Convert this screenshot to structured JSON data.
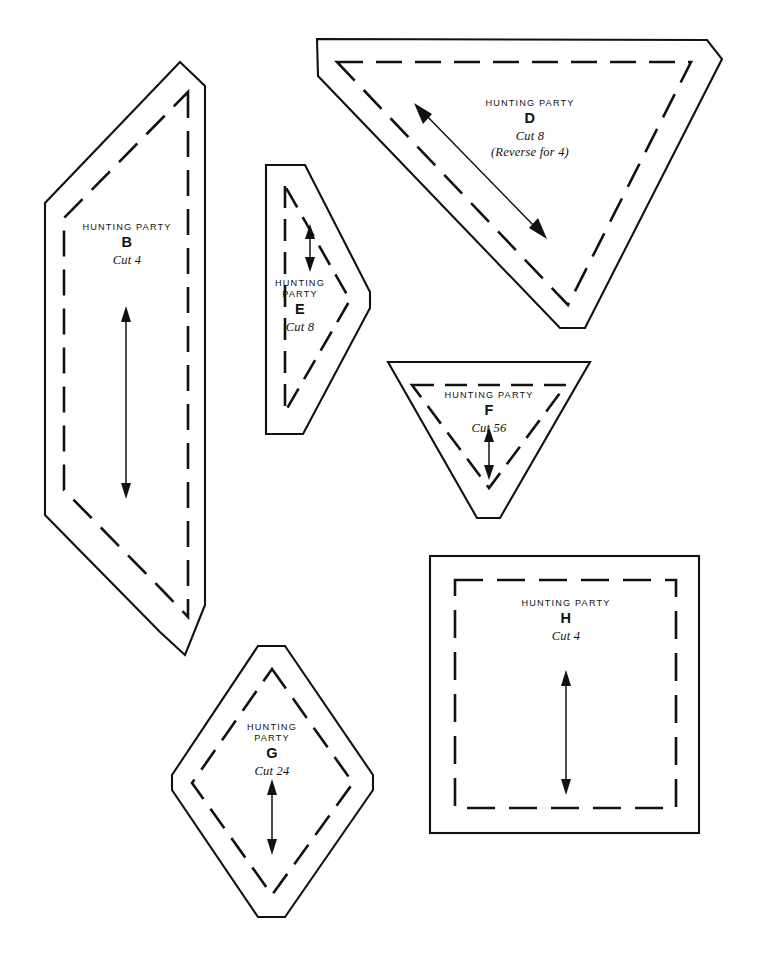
{
  "page": {
    "background_color": "#ffffff",
    "ink_color": "#111111",
    "width": 760,
    "height": 957
  },
  "pattern_name": "HUNTING PARTY",
  "templates": [
    {
      "id": "B",
      "shape": "parallelogram",
      "title": "HUNTING PARTY",
      "letter": "B",
      "cut": "Cut 4",
      "note": "",
      "grainline": "double-arrow-vertical"
    },
    {
      "id": "D",
      "shape": "triangle",
      "title": "HUNTING PARTY",
      "letter": "D",
      "cut": "Cut 8",
      "note": "(Reverse for 4)",
      "grainline": "double-arrow-diagonal"
    },
    {
      "id": "E",
      "shape": "triangle-right",
      "title_line1": "HUNTING",
      "title_line2": "PARTY",
      "title": "HUNTING PARTY",
      "letter": "E",
      "cut": "Cut 8",
      "note": "",
      "grainline": "double-arrow-vertical"
    },
    {
      "id": "F",
      "shape": "triangle-down",
      "title": "HUNTING PARTY",
      "letter": "F",
      "cut": "Cut 56",
      "note": "",
      "grainline": "double-arrow-vertical"
    },
    {
      "id": "G",
      "shape": "diamond",
      "title_line1": "HUNTING",
      "title_line2": "PARTY",
      "title": "HUNTING PARTY",
      "letter": "G",
      "cut": "Cut 24",
      "note": "",
      "grainline": "double-arrow-vertical"
    },
    {
      "id": "H",
      "shape": "square",
      "title": "HUNTING PARTY",
      "letter": "H",
      "cut": "Cut 4",
      "note": "",
      "grainline": "double-arrow-vertical"
    }
  ]
}
